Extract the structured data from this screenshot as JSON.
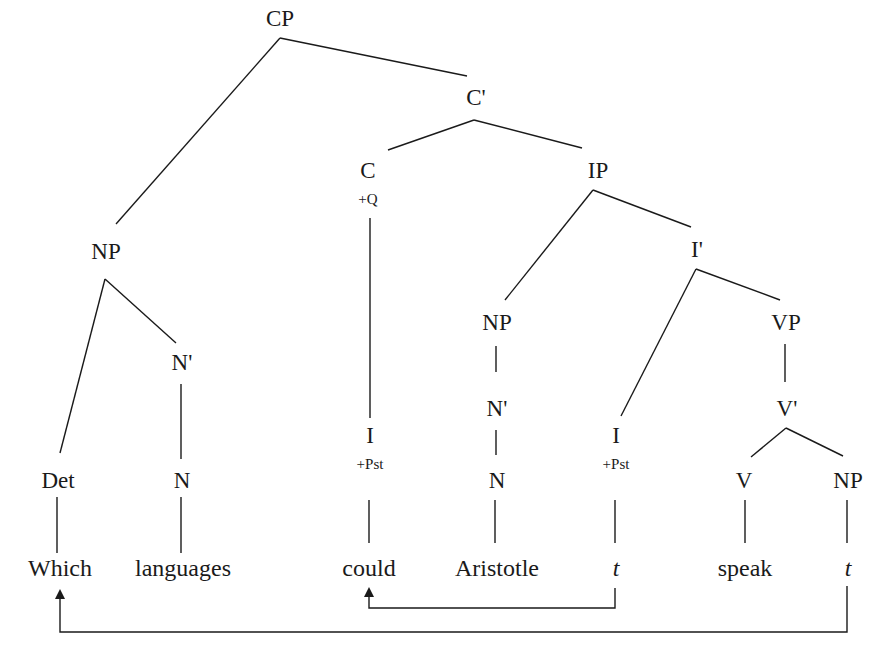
{
  "diagram": {
    "type": "syntax-tree",
    "nodes": {
      "cp": "CP",
      "c_bar": "C'",
      "c": "C",
      "c_feature": "+Q",
      "ip": "IP",
      "np_wh": "NP",
      "n_bar_wh": "N'",
      "det": "Det",
      "n_wh": "N",
      "i_moved": "I",
      "i_moved_feature": "+Pst",
      "np_subj": "NP",
      "n_bar_subj": "N'",
      "n_subj": "N",
      "i_bar": "I'",
      "i_orig": "I",
      "i_orig_feature": "+Pst",
      "vp": "VP",
      "v_bar": "V'",
      "v": "V",
      "np_obj": "NP"
    },
    "leaves": {
      "which": "Which",
      "languages": "languages",
      "could": "could",
      "aristotle": "Aristotle",
      "trace_i": "t",
      "speak": "speak",
      "trace_np": "t"
    },
    "movements": [
      {
        "from": "t (I, +Pst)",
        "to": "could (C)",
        "type": "head-movement"
      },
      {
        "from": "t (NP object)",
        "to": "Which (Spec CP)",
        "type": "wh-movement"
      }
    ]
  }
}
